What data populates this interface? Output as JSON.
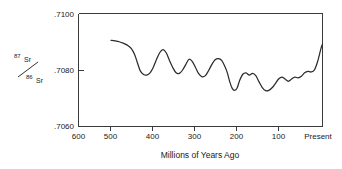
{
  "chart_data": {
    "type": "line",
    "title": "",
    "xlabel": "Millions of Years Ago",
    "ylabel": "87Sr / 86Sr",
    "ylabel_numerator_sup": "87",
    "ylabel_numerator_el": "Sr",
    "ylabel_denominator_sup": "86",
    "ylabel_denominator_el": "Sr",
    "x_tick_labels": [
      "600",
      "500",
      "400",
      "300",
      "200",
      "100",
      "Present"
    ],
    "x_tick_values": [
      600,
      500,
      400,
      300,
      200,
      100,
      0
    ],
    "y_tick_labels": [
      ".7100",
      ".7080",
      ".7060"
    ],
    "y_tick_values": [
      0.71,
      0.708,
      0.706
    ],
    "xlim": [
      600,
      0
    ],
    "ylim": [
      0.706,
      0.71
    ],
    "x_reversed": true,
    "grid": false,
    "legend": "none",
    "line_color": "#2b2b2b",
    "frame_color": "#3a3a3a",
    "series": [
      {
        "name": "Seawater 87Sr/86Sr",
        "x": [
          520,
          510,
          500,
          490,
          480,
          470,
          462,
          455,
          448,
          440,
          432,
          424,
          416,
          408,
          400,
          392,
          384,
          376,
          368,
          360,
          352,
          344,
          336,
          328,
          320,
          312,
          304,
          296,
          288,
          280,
          272,
          264,
          256,
          248,
          240,
          234,
          228,
          222,
          216,
          210,
          204,
          196,
          188,
          180,
          172,
          164,
          156,
          148,
          140,
          132,
          124,
          116,
          108,
          100,
          92,
          84,
          76,
          68,
          60,
          52,
          44,
          36,
          28,
          20,
          12,
          4,
          0
        ],
        "y": [
          0.70905,
          0.70903,
          0.709,
          0.70895,
          0.70888,
          0.70876,
          0.70855,
          0.70825,
          0.70797,
          0.70784,
          0.70782,
          0.7079,
          0.7081,
          0.70838,
          0.70862,
          0.70872,
          0.7086,
          0.70833,
          0.70808,
          0.7079,
          0.70788,
          0.708,
          0.7082,
          0.70838,
          0.7083,
          0.70808,
          0.70786,
          0.70776,
          0.7078,
          0.70798,
          0.7082,
          0.70836,
          0.7084,
          0.70834,
          0.70812,
          0.7079,
          0.70758,
          0.70735,
          0.70728,
          0.70736,
          0.70762,
          0.70785,
          0.7079,
          0.70782,
          0.70788,
          0.7078,
          0.70758,
          0.70738,
          0.70727,
          0.70728,
          0.70737,
          0.70752,
          0.70768,
          0.70775,
          0.70768,
          0.7076,
          0.70768,
          0.70775,
          0.70772,
          0.70778,
          0.7079,
          0.70795,
          0.70793,
          0.708,
          0.7083,
          0.70875,
          0.70892
        ]
      }
    ]
  },
  "axis": {
    "x_title": "Millions of Years Ago",
    "y_num_sup": "87",
    "y_num_el": "Sr",
    "y_den_sup": "86",
    "y_den_el": "Sr",
    "x_ticks": [
      "600",
      "500",
      "400",
      "300",
      "200",
      "100",
      "Present"
    ],
    "y_ticks": [
      ".7100",
      ".7080",
      ".7060"
    ]
  }
}
